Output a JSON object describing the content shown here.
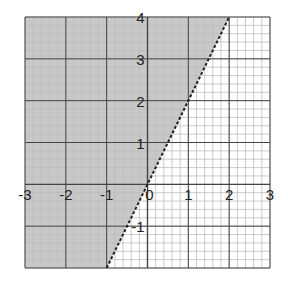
{
  "chart_data": {
    "type": "area",
    "title": "",
    "xlabel": "",
    "ylabel": "",
    "xlim": [
      -3,
      3
    ],
    "ylim": [
      -2,
      4
    ],
    "grid": true,
    "grid_minor_step": 0.2,
    "grid_major_step": 1,
    "x_tick_labels": [
      "-3",
      "-2",
      "-1",
      "0",
      "1",
      "2",
      "3"
    ],
    "y_tick_labels": [
      "-1",
      "1",
      "2",
      "3",
      "4"
    ],
    "boundary": {
      "equation": "y = 2x",
      "style": "dashed",
      "points": [
        [
          -1,
          -2
        ],
        [
          2,
          4
        ]
      ]
    },
    "shaded_region": {
      "inequality": "y > 2x",
      "description": "region above/left of the dashed line",
      "polygon": [
        [
          -3,
          -2
        ],
        [
          -1,
          -2
        ],
        [
          2,
          4
        ],
        [
          -3,
          4
        ]
      ]
    },
    "colors": {
      "shade": "#c8c8c8",
      "minor_grid": "#bdbdbd",
      "major_grid": "#444444",
      "boundary": "#222222"
    }
  }
}
